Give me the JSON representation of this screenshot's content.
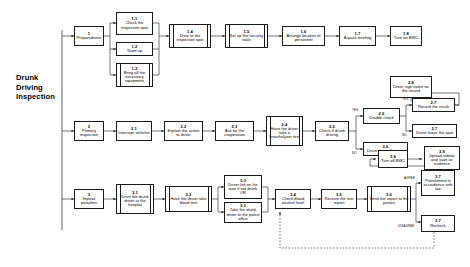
{
  "diagram": {
    "phase_title": "Drunk\nDriving\nInspection",
    "title_lines": [
      "Drunk",
      "Driving",
      "Inspection"
    ]
  },
  "nodes": {
    "n1": {
      "num": "1",
      "label": "Preparedness"
    },
    "n1_1": {
      "num": "1.1",
      "label": "Check the inspection spot"
    },
    "n1_2": {
      "num": "1.2",
      "label": "Team up"
    },
    "n1_3": {
      "num": "1.3",
      "label": "Bring all the necessary equipment"
    },
    "n1_4": {
      "num": "1.4",
      "label": "Drive to the inspection spot"
    },
    "n1_5": {
      "num": "1.5",
      "label": "Set up the security tools"
    },
    "n1_6": {
      "num": "1.6",
      "label": "Arrange location of personnel"
    },
    "n1_7": {
      "num": "1.7",
      "label": "A quick briefing"
    },
    "n1_8": {
      "num": "1.8",
      "label": "Turn on BWC"
    },
    "n2": {
      "num": "2",
      "label": "Primary inspection"
    },
    "n2_1": {
      "num": "2.1",
      "label": "Intercept vehicles"
    },
    "n2_2": {
      "num": "2.2",
      "label": "Explain the action to driver"
    },
    "n2_3": {
      "num": "2.3",
      "label": "Ask for the cooperation"
    },
    "n2_4": {
      "num": "2.4",
      "label": "Have the driver take a breathalyzer test"
    },
    "n2_5": {
      "num": "2.5",
      "label": "Check if drunk driving"
    },
    "n2_6a": {
      "num": "2.6",
      "label": "Double check"
    },
    "n2_6b": {
      "num": "2.6",
      "label": "Driver leave the spot"
    },
    "n2_7a": {
      "num": "2.7",
      "label": "Record the result"
    },
    "n2_7b": {
      "num": "2.7",
      "label": "Driver leave the spot"
    },
    "n2_8": {
      "num": "2.8",
      "label": "Driver sign name on the record"
    },
    "n3": {
      "num": "3",
      "label": "Impose penalties"
    },
    "n3_1": {
      "num": "3.1",
      "label": "Drive the drunk driver to the hospital"
    },
    "n3_2": {
      "num": "3.2",
      "label": "Have the driver take blood test"
    },
    "n3_3a": {
      "num": "3.3",
      "label": "Driver left on his own if not drunk"
    },
    "n3_3a_or": "OR",
    "n3_3b": {
      "num": "3.3",
      "label": "Take the drunk driver to the police office"
    },
    "n3_4": {
      "num": "3.4",
      "label": "Check blood alcohol level"
    },
    "n3_5": {
      "num": "3.5",
      "label": "Receive the test report"
    },
    "n3_6": {
      "num": "3.6",
      "label": "Send the report to the parties"
    },
    "n3_7a": {
      "num": "3.7",
      "label": "Punishment in accordance with law"
    },
    "n3_7b": {
      "num": "3.7",
      "label": "Recheck"
    },
    "n3_8": {
      "num": "3.8",
      "label": "Turn off BWC"
    },
    "n3_9": {
      "num": "3.9",
      "label": "Upload videos and save as evidence"
    }
  },
  "edge_labels": {
    "yes_2_5": "YES",
    "no_2_5": "NO",
    "yes_2_6": "YES",
    "no_2_6": "NO",
    "agree": "AGREE",
    "disagree": "DISAGREE"
  },
  "colors": {
    "stroke": "#1a1a1a",
    "text": "#000000",
    "background": "#ffffff"
  }
}
